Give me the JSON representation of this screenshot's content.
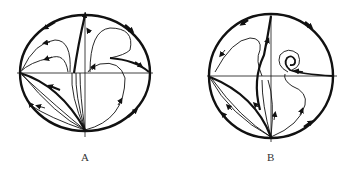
{
  "figure": {
    "panels": [
      {
        "id": "A",
        "label": "A"
      },
      {
        "id": "B",
        "label": "B"
      }
    ],
    "colors": {
      "stroke": "#111111",
      "background": "#ffffff"
    }
  }
}
